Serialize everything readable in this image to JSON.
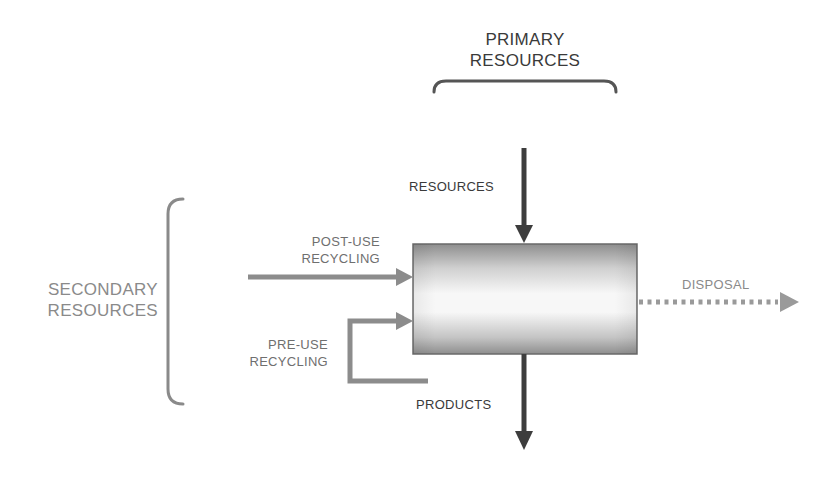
{
  "diagram": {
    "top_group": {
      "line1": "PRIMARY",
      "line2": "RESOURCES"
    },
    "left_group": {
      "line1": "SECONDARY",
      "line2": "RESOURCES"
    },
    "flows": {
      "resources": "RESOURCES",
      "post_use": {
        "line1": "POST-USE",
        "line2": "RECYCLING"
      },
      "pre_use": {
        "line1": "PRE-USE",
        "line2": "RECYCLING"
      },
      "products": "PRODUCTS",
      "disposal": "DISPOSAL"
    },
    "colors": {
      "dark_arrow": "#3d3d3d",
      "recycling_arrow": "#8c8c8c",
      "disposal_arrow": "#9a9a9a",
      "brace": "#7a7a7a"
    }
  }
}
